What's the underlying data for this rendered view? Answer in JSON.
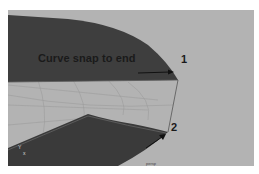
{
  "viewport": {
    "camera_label": "persp",
    "background_color": "#b3b3b3",
    "surface_color": "#3e3e3e",
    "grid_color": "#9a9a9a"
  },
  "annotation": {
    "title": "Curve snap to end",
    "points": [
      {
        "id": "1",
        "label": "1"
      },
      {
        "id": "2",
        "label": "2"
      }
    ]
  },
  "axis_indicator": {
    "y_label": "Y",
    "x_label": "x"
  },
  "icons": [
    "arrow-right-icon",
    "arrow-up-right-icon",
    "axis-gizmo-icon"
  ]
}
